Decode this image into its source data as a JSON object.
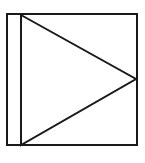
{
  "figure": {
    "canvas": {
      "width": 145,
      "height": 163,
      "background_color": "#ffffff"
    },
    "stroke": {
      "color": "#1a1a1a",
      "width": 2,
      "linejoin": "miter"
    },
    "shapes": [
      {
        "name": "outer-square",
        "type": "rect",
        "x": 7,
        "y": 14,
        "width": 130,
        "height": 131,
        "points": "7,14 137,14 137,145 7,145",
        "fill": "none"
      },
      {
        "name": "inner-triangle",
        "type": "polygon",
        "points": "21,15 136,79 21,145",
        "vertices": [
          {
            "label": "top-left",
            "x": 21,
            "y": 15
          },
          {
            "label": "right-apex",
            "x": 136,
            "y": 79
          },
          {
            "label": "bottom-left",
            "x": 21,
            "y": 145
          }
        ],
        "fill": "none"
      }
    ]
  }
}
